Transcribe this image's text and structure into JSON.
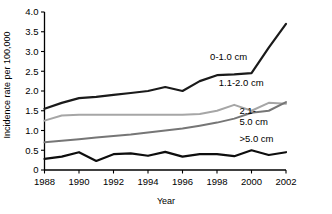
{
  "chart_data": {
    "type": "line",
    "title": "",
    "xlabel": "Year",
    "ylabel": "Incidence rate per 100,000",
    "xlim": [
      1988,
      2002
    ],
    "ylim": [
      0,
      4.0
    ],
    "yticks": [
      "0",
      "0.5",
      "1.0",
      "1.5",
      "2.0",
      "2.5",
      "3.0",
      "3.5",
      "4.0"
    ],
    "ytick_values": [
      0,
      0.5,
      1.0,
      1.5,
      2.0,
      2.5,
      3.0,
      3.5,
      4.0
    ],
    "xticks": [
      "1988",
      "1990",
      "1992",
      "1994",
      "1996",
      "1998",
      "2000",
      "2002"
    ],
    "xtick_values": [
      1988,
      1990,
      1992,
      1994,
      1996,
      1998,
      2000,
      2002
    ],
    "grid": false,
    "legend_position": "inline-right",
    "x": [
      1988,
      1989,
      1990,
      1991,
      1992,
      1993,
      1994,
      1995,
      1996,
      1997,
      1998,
      1999,
      2000,
      2001,
      2002
    ],
    "series": [
      {
        "name": "0-1.0 cm",
        "color": "#1a1a1a",
        "width": 2.2,
        "label_x": 1997.6,
        "label_y": 2.78,
        "values": [
          1.55,
          1.7,
          1.82,
          1.85,
          1.9,
          1.95,
          2.0,
          2.1,
          2.0,
          2.25,
          2.4,
          2.42,
          2.45,
          3.1,
          3.7
        ]
      },
      {
        "name": "1.1-2.0 cm",
        "color": "#a6a6a6",
        "width": 2.0,
        "label_x": 1998.1,
        "label_y": 2.12,
        "values": [
          1.25,
          1.38,
          1.4,
          1.4,
          1.4,
          1.4,
          1.4,
          1.4,
          1.4,
          1.42,
          1.5,
          1.65,
          1.5,
          1.7,
          1.68
        ]
      },
      {
        "name": "2.1-\n5.0 cm",
        "color": "#767676",
        "width": 2.0,
        "label_x": 1999.3,
        "label_y": 1.42,
        "values": [
          0.7,
          0.74,
          0.78,
          0.82,
          0.86,
          0.9,
          0.95,
          1.0,
          1.05,
          1.12,
          1.2,
          1.3,
          1.45,
          1.5,
          1.72
        ]
      },
      {
        "name": ">5.0 cm",
        "color": "#0d0d0d",
        "width": 2.2,
        "label_x": 1999.3,
        "label_y": 0.72,
        "values": [
          0.28,
          0.34,
          0.45,
          0.23,
          0.4,
          0.42,
          0.36,
          0.46,
          0.34,
          0.4,
          0.4,
          0.35,
          0.5,
          0.38,
          0.45
        ]
      }
    ],
    "series_labels": [
      "0-1.0 cm",
      "1.1-2.0 cm",
      "2.1-",
      "5.0 cm",
      ">5.0 cm"
    ]
  }
}
